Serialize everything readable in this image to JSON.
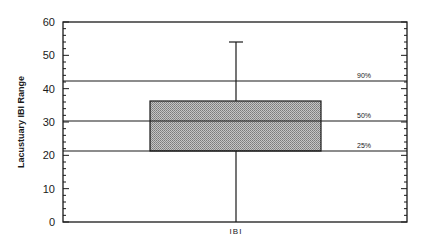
{
  "chart_data": {
    "type": "box",
    "title": "",
    "xlabel": "",
    "ylabel": "Lacustuary IBI Range",
    "ylim": [
      0,
      60
    ],
    "yticks": [
      0,
      10,
      20,
      30,
      40,
      50,
      60
    ],
    "ytick_labels": [
      "0",
      "10",
      "20",
      "30",
      "40",
      "50",
      "60"
    ],
    "minor_ticks_per_major": 5,
    "grid": false,
    "categories": [
      "IBI"
    ],
    "category_label": "IBI",
    "box": {
      "q1": 21.3,
      "median": 30.3,
      "q3": 36.3,
      "whisker_low": 0,
      "whisker_high": 54
    },
    "reference_lines": [
      {
        "label": "90%",
        "value": 42.3
      },
      {
        "label": "50%",
        "value": 30.3
      },
      {
        "label": "25%",
        "value": 21.3
      }
    ],
    "colors": {
      "box_fill": "#a9a9a9",
      "line": "#1a1a1a",
      "background": "#ffffff"
    }
  }
}
